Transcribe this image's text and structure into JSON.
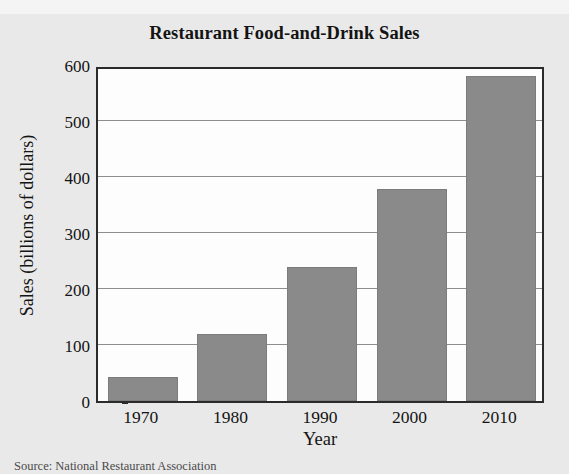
{
  "chart_data": {
    "type": "bar",
    "title": "Restaurant Food-and-Drink Sales",
    "xlabel": "Year",
    "ylabel": "Sales (billions of dollars)",
    "categories": [
      "1970",
      "1980",
      "1990",
      "2000",
      "2010"
    ],
    "values": [
      42,
      120,
      239,
      379,
      580
    ],
    "ylim": [
      0,
      600
    ],
    "yticks": [
      0,
      100,
      200,
      300,
      400,
      500,
      600
    ],
    "ytick_labels": [
      "0",
      "100",
      "200",
      "300",
      "400",
      "500",
      "600"
    ],
    "grid": "horizontal",
    "legend": "none",
    "series": [
      {
        "name": "Sales",
        "values": [
          42,
          120,
          239,
          379,
          580
        ]
      }
    ],
    "bar_color": "#8a8a8a",
    "plot_background": "#fdfdfd",
    "figure_background": "#e9e9e9",
    "axis_color": "#2b2b2b",
    "gridline_color": "#8d8d8d"
  },
  "source_note": "Source: National Restaurant Association"
}
